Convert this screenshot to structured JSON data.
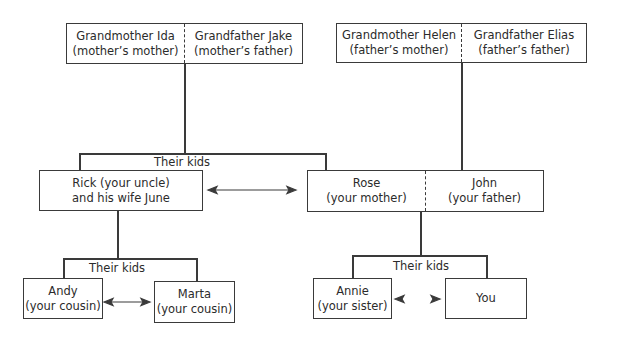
{
  "diagram": {
    "type": "family-tree",
    "grandparents_maternal": {
      "left": {
        "name": "Grandmother Ida",
        "relation": "(mother’s mother)"
      },
      "right": {
        "name": "Grandfather Jake",
        "relation": "(mother’s father)"
      }
    },
    "grandparents_paternal": {
      "left": {
        "name": "Grandmother Helen",
        "relation": "(father’s mother)"
      },
      "right": {
        "name": "Grandfather Elias",
        "relation": "(father’s father)"
      }
    },
    "kids_label_top": "Their kids",
    "uncle_box": {
      "line1": "Rick (your uncle)",
      "line2": "and his wife June"
    },
    "parents_box": {
      "left": {
        "name": "Rose",
        "relation": "(your mother)"
      },
      "right": {
        "name": "John",
        "relation": "(your father)"
      }
    },
    "cousins_kids_label": "Their kids",
    "cousin1": {
      "name": "Andy",
      "relation": "(your cousin)"
    },
    "cousin2": {
      "name": "Marta",
      "relation": "(your cousin)"
    },
    "siblings_kids_label": "Their kids",
    "sister": {
      "name": "Annie",
      "relation": "(your sister)"
    },
    "you": {
      "name": "You"
    },
    "colors": {
      "line": "#3a3a3a",
      "text": "#2b2b2b",
      "background": "#ffffff"
    }
  }
}
